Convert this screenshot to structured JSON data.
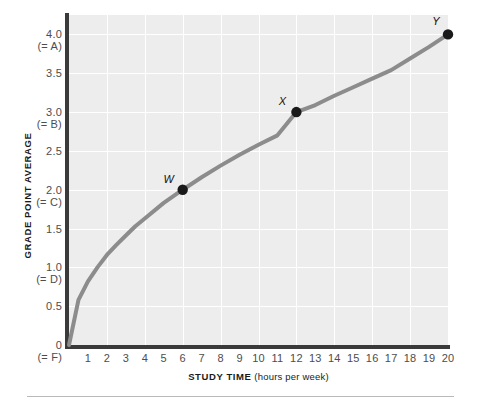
{
  "chart_data": {
    "type": "line",
    "title": "",
    "xlabel_bold": "STUDY TIME",
    "xlabel_paren": "(hours per week)",
    "ylabel": "GRADE POINT AVERAGE",
    "xlim": [
      0,
      20
    ],
    "ylim": [
      0,
      4.25
    ],
    "grid": true,
    "legend": "none",
    "x_ticks": [
      "0",
      "1",
      "2",
      "3",
      "4",
      "5",
      "6",
      "7",
      "8",
      "9",
      "10",
      "11",
      "12",
      "13",
      "14",
      "15",
      "16",
      "17",
      "18",
      "19",
      "20"
    ],
    "x_tick_values": [
      0,
      1,
      2,
      3,
      4,
      5,
      6,
      7,
      8,
      9,
      10,
      11,
      12,
      13,
      14,
      15,
      16,
      17,
      18,
      19,
      20
    ],
    "x_origin_sublabel": "(= F)",
    "y_ticks": [
      {
        "value": 4.0,
        "num": "4.0",
        "grade": "(= A)"
      },
      {
        "value": 3.5,
        "num": "3.5",
        "grade": ""
      },
      {
        "value": 3.0,
        "num": "3.0",
        "grade": "(= B)"
      },
      {
        "value": 2.5,
        "num": "2.5",
        "grade": ""
      },
      {
        "value": 2.0,
        "num": "2.0",
        "grade": "(= C)"
      },
      {
        "value": 1.5,
        "num": "1.5",
        "grade": ""
      },
      {
        "value": 1.0,
        "num": "1.0",
        "grade": "(= D)"
      },
      {
        "value": 0.5,
        "num": "0.5",
        "grade": ""
      },
      {
        "value": 0.0,
        "num": "0",
        "grade": "(= F)"
      }
    ],
    "series": [
      {
        "name": "GPA vs study time",
        "color": "#8c8c8c",
        "x": [
          0,
          0.5,
          1,
          1.5,
          2,
          2.5,
          3,
          3.5,
          4,
          5,
          6,
          7,
          8,
          9,
          10,
          11,
          12,
          13,
          14,
          15,
          16,
          17,
          18,
          19,
          20
        ],
        "y": [
          0,
          0.58,
          0.82,
          1.0,
          1.16,
          1.29,
          1.41,
          1.53,
          1.63,
          1.83,
          2.0,
          2.16,
          2.31,
          2.45,
          2.58,
          2.7,
          3.0,
          3.09,
          3.21,
          3.32,
          3.43,
          3.54,
          3.69,
          3.84,
          4.0
        ]
      }
    ],
    "points": [
      {
        "label": "W",
        "x": 6,
        "y": 2.0,
        "label_dx": -14,
        "label_dy": -17
      },
      {
        "label": "X",
        "x": 12,
        "y": 3.0,
        "label_dx": -14,
        "label_dy": -17
      },
      {
        "label": "Y",
        "x": 20,
        "y": 4.0,
        "label_dx": -12,
        "label_dy": -19
      }
    ],
    "colors": {
      "curve": "#8c8c8c",
      "point": "#1a1a1a",
      "plot_background": "#ededed",
      "gridline": "#ffffff",
      "axis_spine": "#3a3a3a",
      "tick_label": "#4d4d4d",
      "axis_title": "#1a1a1a",
      "bottom_rule": "#b9b9b9",
      "figure_background": "#ffffff"
    },
    "grid_spacing": {
      "x_major_every": 2,
      "y_major_every": 0.5
    }
  }
}
